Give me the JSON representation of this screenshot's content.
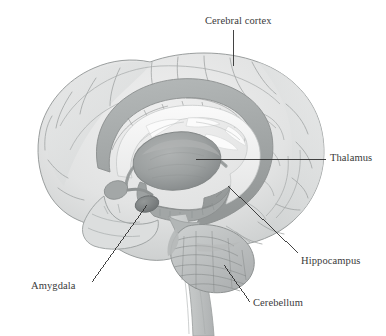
{
  "figure": {
    "kind": "anatomical-illustration",
    "background_color": "#ffffff",
    "ink_color": "#3a3a3a",
    "style": "grayscale pencil/airbrush rendering",
    "palette": {
      "cortex_light": "#e6e7e7",
      "cortex_mid": "#d2d4d4",
      "cortex_shadow": "#b9bcbc",
      "sulcus_line": "#9fa3a3",
      "outline": "#9a9e9e",
      "limbic_band": "#a9adad",
      "limbic_band_dark": "#8e9292",
      "corpus_callosum": "#f2f2f2",
      "ventricle_white": "#fbfbfb",
      "thalamus_fill": "#9b9e9e",
      "thalamus_shadow": "#8a8d8d",
      "amygdala_fill": "#7d8181",
      "cerebellum_fill": "#bdc0c0",
      "cerebellum_folia": "#8e9292",
      "brainstem_fill": "#c4c7c7",
      "leader_line": "#2f2f2f"
    }
  },
  "labels": [
    {
      "id": "cerebral-cortex",
      "text": "Cerebral cortex",
      "leader": {
        "from": [
          233,
          30
        ],
        "to": [
          233,
          66
        ],
        "kind": "straight-vertical"
      }
    },
    {
      "id": "thalamus",
      "text": "Thalamus",
      "leader": {
        "from": [
          326,
          159
        ],
        "to": [
          196,
          159
        ],
        "kind": "straight-horizontal"
      }
    },
    {
      "id": "hippocampus",
      "text": "Hippocampus",
      "leader": {
        "from": [
          298,
          253
        ],
        "to": [
          228,
          186
        ],
        "kind": "straight-diagonal"
      }
    },
    {
      "id": "amygdala",
      "text": "Amygdala",
      "leader": {
        "from": [
          92,
          282
        ],
        "to": [
          147,
          205
        ],
        "kind": "straight-diagonal"
      }
    },
    {
      "id": "cerebellum",
      "text": "Cerebellum",
      "leader": {
        "from": [
          250,
          302
        ],
        "to": [
          224,
          265
        ],
        "kind": "straight-diagonal"
      }
    }
  ],
  "structures": [
    {
      "name": "cerebral cortex",
      "labeled": true,
      "region": "outer convoluted mantle of gyri and sulci"
    },
    {
      "name": "thalamus",
      "labeled": true,
      "region": "central ovoid gray mass"
    },
    {
      "name": "hippocampus",
      "labeled": true,
      "region": "curved medial temporal band below thalamus"
    },
    {
      "name": "amygdala",
      "labeled": true,
      "region": "small almond body anterior to hippocampus"
    },
    {
      "name": "cerebellum",
      "labeled": true,
      "region": "foliated posterior-inferior mass"
    },
    {
      "name": "corpus callosum",
      "labeled": false,
      "region": "pale arch above thalamus"
    },
    {
      "name": "cingulate gyrus",
      "labeled": false,
      "region": "gray band arching over corpus callosum"
    },
    {
      "name": "fornix",
      "labeled": false,
      "region": "thin arch from thalamus to temporal lobe"
    },
    {
      "name": "lateral ventricle",
      "labeled": false,
      "region": "white spaces above thalamus"
    },
    {
      "name": "brainstem",
      "labeled": false,
      "region": "descending column to lower edge"
    }
  ]
}
